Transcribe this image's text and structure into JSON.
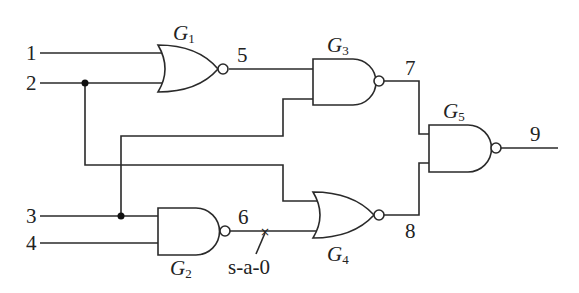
{
  "diagram": {
    "type": "logic-circuit",
    "inputs": [
      {
        "id": "1",
        "label": "1"
      },
      {
        "id": "2",
        "label": "2"
      },
      {
        "id": "3",
        "label": "3"
      },
      {
        "id": "4",
        "label": "4"
      }
    ],
    "gates": [
      {
        "id": "G1",
        "label": "G",
        "sub": "1",
        "type": "NOR",
        "inputs": [
          "1",
          "2"
        ],
        "output": "5"
      },
      {
        "id": "G2",
        "label": "G",
        "sub": "2",
        "type": "NAND",
        "inputs": [
          "3",
          "4"
        ],
        "output": "6"
      },
      {
        "id": "G3",
        "label": "G",
        "sub": "3",
        "type": "NAND",
        "inputs": [
          "5",
          "3"
        ],
        "output": "7"
      },
      {
        "id": "G4",
        "label": "G",
        "sub": "4",
        "type": "NOR",
        "inputs": [
          "2",
          "6"
        ],
        "output": "8"
      },
      {
        "id": "G5",
        "label": "G",
        "sub": "5",
        "type": "NAND",
        "inputs": [
          "7",
          "8"
        ],
        "output": "9"
      }
    ],
    "nets": {
      "n5": "5",
      "n6": "6",
      "n7": "7",
      "n8": "8",
      "n9": "9"
    },
    "fault": {
      "net": "6",
      "label": "s-a-0",
      "marker": "×"
    }
  }
}
